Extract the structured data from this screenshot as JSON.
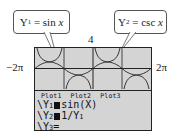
{
  "callouts": [
    {
      "lhs": "Y",
      "sub": "1",
      "eq": " = sin ",
      "var": "x"
    },
    {
      "lhs": "Y",
      "sub": "2",
      "eq": " = csc ",
      "var": "x"
    }
  ],
  "window": {
    "xmin_label": "−2π",
    "xmax_label": "2π",
    "ymax_label": "4"
  },
  "plots": [
    "Plot1",
    "Plot2",
    "Plot3"
  ],
  "equations": [
    {
      "prefix": "\\Y",
      "sub": "1",
      "selected": true,
      "expr": "sin(X)"
    },
    {
      "prefix": "\\Y",
      "sub": "2",
      "selected": true,
      "expr": "1/Y"
    },
    {
      "prefix": "\\Y",
      "sub": "3",
      "selected": false,
      "expr": "="
    }
  ],
  "eq2_sub": "1",
  "colors": {
    "screen": "#d4d4d4",
    "ink": "#111111"
  }
}
